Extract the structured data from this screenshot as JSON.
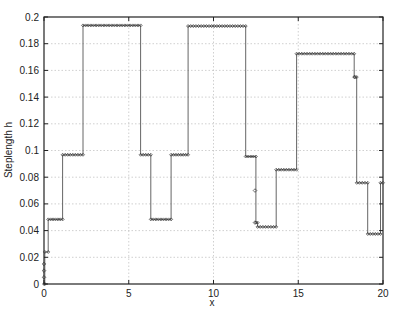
{
  "chart_data": {
    "type": "line",
    "title": "",
    "xlabel": "x",
    "ylabel": "Steplength h",
    "xlim": [
      0,
      20
    ],
    "ylim": [
      0,
      0.2
    ],
    "grid": true,
    "legend": null,
    "x_ticks": [
      "0",
      "5",
      "10",
      "15",
      "20"
    ],
    "y_ticks": [
      "0",
      "0.02",
      "0.04",
      "0.06",
      "0.08",
      "0.1",
      "0.12",
      "0.14",
      "0.16",
      "0.18",
      "0.2"
    ],
    "marker": "diamond",
    "series": [
      {
        "name": "Steplength h",
        "style": "step",
        "segments": [
          {
            "x_start": 0.0,
            "x_end": 0.05,
            "h": 0.0
          },
          {
            "x_start": 0.05,
            "x_end": 0.25,
            "h": 0.024
          },
          {
            "x_start": 0.25,
            "x_end": 1.1,
            "h": 0.0484
          },
          {
            "x_start": 1.1,
            "x_end": 2.3,
            "h": 0.0968
          },
          {
            "x_start": 2.3,
            "x_end": 5.7,
            "h": 0.1937
          },
          {
            "x_start": 5.7,
            "x_end": 6.3,
            "h": 0.0968
          },
          {
            "x_start": 6.3,
            "x_end": 7.5,
            "h": 0.0484
          },
          {
            "x_start": 7.5,
            "x_end": 8.5,
            "h": 0.0968
          },
          {
            "x_start": 8.5,
            "x_end": 11.9,
            "h": 0.1932
          },
          {
            "x_start": 11.9,
            "x_end": 12.5,
            "h": 0.0955
          },
          {
            "x_start": 12.5,
            "x_end": 12.6,
            "h": 0.046
          },
          {
            "x_start": 12.6,
            "x_end": 13.7,
            "h": 0.0428
          },
          {
            "x_start": 13.7,
            "x_end": 14.9,
            "h": 0.0856
          },
          {
            "x_start": 14.9,
            "x_end": 18.3,
            "h": 0.1725
          },
          {
            "x_start": 18.3,
            "x_end": 18.45,
            "h": 0.155
          },
          {
            "x_start": 18.45,
            "x_end": 19.1,
            "h": 0.0758
          },
          {
            "x_start": 19.1,
            "x_end": 19.85,
            "h": 0.0375
          },
          {
            "x_start": 19.85,
            "x_end": 20.0,
            "h": 0.0758
          }
        ],
        "isolated_points": [
          {
            "x": 0.0,
            "h": 0.005
          },
          {
            "x": 0.0,
            "h": 0.01
          },
          {
            "x": 0.0,
            "h": 0.015
          },
          {
            "x": 12.45,
            "h": 0.07
          },
          {
            "x": 12.45,
            "h": 0.046
          },
          {
            "x": 18.35,
            "h": 0.155
          }
        ]
      }
    ]
  },
  "colors": {
    "line": "#555555",
    "marker": "#333333",
    "grid": "#bbbbbb",
    "frame": "#222222",
    "background": "#ffffff"
  }
}
